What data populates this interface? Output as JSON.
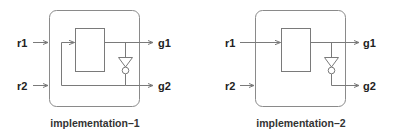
{
  "diagrams": [
    {
      "caption": "implementation–1",
      "inputs": [
        "r1",
        "r2"
      ],
      "outputs": [
        "g1",
        "g2"
      ],
      "components": [
        "block",
        "inverter"
      ],
      "feedback": "g2 fed back into block input alongside r1"
    },
    {
      "caption": "implementation–2",
      "inputs": [
        "r1",
        "r2"
      ],
      "outputs": [
        "g1",
        "g2"
      ],
      "components": [
        "block",
        "inverter"
      ],
      "feedback": "none; r2 unconnected inside"
    }
  ],
  "colors": {
    "line": "#7a7a7a",
    "text": "#222222",
    "background": "#ffffff"
  }
}
